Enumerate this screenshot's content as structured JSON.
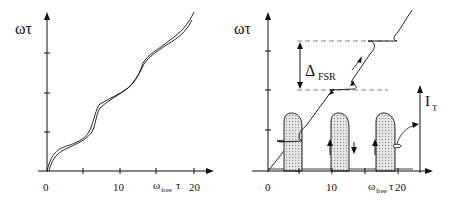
{
  "left_panel": {
    "y_label": "ωτ",
    "x_label_main": "ω",
    "x_label_sub": "free",
    "x_label_tail": "τ",
    "x_ticks": [
      "0",
      "10",
      "20"
    ]
  },
  "right_panel": {
    "y_label": "ωτ",
    "x_label_main": "ω",
    "x_label_sub": "free",
    "x_label_tail": "τ",
    "x_ticks": [
      "0",
      "10",
      "20"
    ],
    "delta_label_main": "Δ",
    "delta_label_sub": "FSR",
    "current_label_main": "I",
    "current_label_sub": "T"
  },
  "colors": {
    "line": "#111111",
    "shade": "#d8d8d8",
    "dash": "#666666"
  }
}
